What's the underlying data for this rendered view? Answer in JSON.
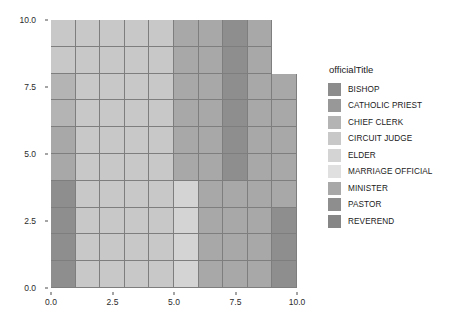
{
  "chart_data": {
    "type": "heatmap",
    "title": "",
    "xlabel": "",
    "ylabel": "",
    "xlim": [
      0.0,
      10.0
    ],
    "ylim": [
      0.0,
      10.0
    ],
    "grid": true,
    "legend_position": "right",
    "x_ticks": [
      "0.0",
      "2.5",
      "5.0",
      "7.5",
      "10.0"
    ],
    "x_tick_values": [
      0.0,
      2.5,
      5.0,
      7.5,
      10.0
    ],
    "y_ticks": [
      "0.0",
      "2.5",
      "5.0",
      "7.5",
      "10.0"
    ],
    "y_tick_values": [
      0.0,
      2.5,
      5.0,
      7.5,
      10.0
    ],
    "legend_title": "officialTitle",
    "categories": [
      "BISHOP",
      "CATHOLIC PRIEST",
      "CHIEF CLERK",
      "CIRCUIT JUDGE",
      "ELDER",
      "MARRIAGE OFFICIAL",
      "MINISTER",
      "PASTOR",
      "REVEREND"
    ],
    "category_colors": [
      "#8c8c8c",
      "#989898",
      "#b4b4b4",
      "#c8c8c8",
      "#d4d4d4",
      "#e0e0e0",
      "#a8a8a8",
      "#8e8e8e",
      "#868686"
    ],
    "x_bins": [
      0.5,
      1.5,
      2.5,
      3.5,
      4.5,
      5.5,
      6.5,
      7.5,
      8.5,
      9.5
    ],
    "y_bins": [
      0.5,
      1.5,
      2.5,
      3.5,
      4.5,
      5.5,
      6.5,
      7.5,
      8.5,
      9.5
    ],
    "note": "Tile grid of officialTitle category by x/y bin. Rows listed top (y=10) to bottom (y=0). null = no tile drawn.",
    "tile_categories": [
      [
        "CIRCUIT JUDGE",
        "CIRCUIT JUDGE",
        "CIRCUIT JUDGE",
        "CIRCUIT JUDGE",
        "CIRCUIT JUDGE",
        "MINISTER",
        "MINISTER",
        "PASTOR",
        "MINISTER",
        null
      ],
      [
        "CIRCUIT JUDGE",
        "CIRCUIT JUDGE",
        "CIRCUIT JUDGE",
        "CIRCUIT JUDGE",
        "CIRCUIT JUDGE",
        "MINISTER",
        "MINISTER",
        "PASTOR",
        "MINISTER",
        null
      ],
      [
        "CHIEF CLERK",
        "CIRCUIT JUDGE",
        "CIRCUIT JUDGE",
        "CIRCUIT JUDGE",
        "CIRCUIT JUDGE",
        "MINISTER",
        "MINISTER",
        "PASTOR",
        "MINISTER",
        "MINISTER"
      ],
      [
        "CHIEF CLERK",
        "CIRCUIT JUDGE",
        "CIRCUIT JUDGE",
        "CIRCUIT JUDGE",
        "CIRCUIT JUDGE",
        "MINISTER",
        "MINISTER",
        "PASTOR",
        "MINISTER",
        "MINISTER"
      ],
      [
        "MINISTER",
        "CIRCUIT JUDGE",
        "CIRCUIT JUDGE",
        "CIRCUIT JUDGE",
        "CIRCUIT JUDGE",
        "MINISTER",
        "MINISTER",
        "PASTOR",
        "MINISTER",
        "MINISTER"
      ],
      [
        "MINISTER",
        "CIRCUIT JUDGE",
        "CIRCUIT JUDGE",
        "CIRCUIT JUDGE",
        "CIRCUIT JUDGE",
        "MINISTER",
        "MINISTER",
        "PASTOR",
        "MINISTER",
        "MINISTER"
      ],
      [
        "PASTOR",
        "CIRCUIT JUDGE",
        "CIRCUIT JUDGE",
        "CIRCUIT JUDGE",
        "CIRCUIT JUDGE",
        "ELDER",
        "MINISTER",
        "MINISTER",
        "MINISTER",
        "MINISTER"
      ],
      [
        "PASTOR",
        "CIRCUIT JUDGE",
        "CIRCUIT JUDGE",
        "CIRCUIT JUDGE",
        "CIRCUIT JUDGE",
        "ELDER",
        "MINISTER",
        "MINISTER",
        "MINISTER",
        "PASTOR"
      ],
      [
        "PASTOR",
        "CIRCUIT JUDGE",
        "CIRCUIT JUDGE",
        "CIRCUIT JUDGE",
        "CIRCUIT JUDGE",
        "ELDER",
        "MINISTER",
        "MINISTER",
        "MINISTER",
        "PASTOR"
      ],
      [
        "PASTOR",
        "CIRCUIT JUDGE",
        "CIRCUIT JUDGE",
        "CIRCUIT JUDGE",
        "CIRCUIT JUDGE",
        "ELDER",
        "MINISTER",
        "MINISTER",
        "MINISTER",
        "PASTOR"
      ]
    ]
  },
  "style": {
    "panel_background": "#ffffff",
    "tile_border": "#7e7e7e",
    "axis_text": "#2b2b2b",
    "legend_text": "#1a1a1a"
  }
}
